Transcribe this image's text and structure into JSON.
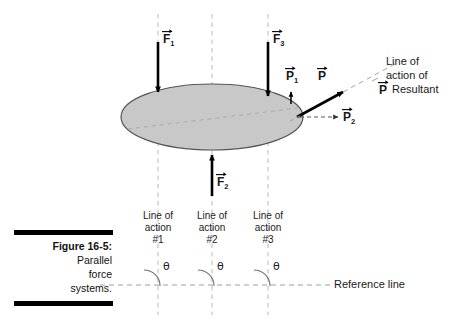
{
  "figure": {
    "caption_title": "Figure 16-5:",
    "caption_lines": [
      "Parallel",
      "force",
      "systems."
    ],
    "bar_color": "#000000"
  },
  "body": {
    "shape": "ellipse",
    "fill_color": "#c8c8c8",
    "stroke_color": "#555555"
  },
  "forces": [
    {
      "id": "F1",
      "symbol": "F",
      "subscript": "1",
      "direction": "down",
      "label": "F⃗1"
    },
    {
      "id": "F2",
      "symbol": "F",
      "subscript": "2",
      "direction": "up",
      "label": "F⃗2"
    },
    {
      "id": "F3",
      "symbol": "F",
      "subscript": "3",
      "direction": "down",
      "label": "F⃗3"
    }
  ],
  "resultant_components": [
    {
      "id": "P1",
      "symbol": "P",
      "subscript": "1",
      "direction": "up",
      "label": "P⃗1"
    },
    {
      "id": "P",
      "symbol": "P",
      "subscript": "",
      "direction": "diagonal-up-right",
      "label": "P⃗"
    },
    {
      "id": "P2",
      "symbol": "P",
      "subscript": "2",
      "direction": "right",
      "label": "P⃗2"
    }
  ],
  "resultant_note": {
    "line1": "Line of",
    "line2": "action of",
    "symbol": "P",
    "line3": "Resultant"
  },
  "lines_of_action": [
    {
      "title_line1": "Line of",
      "title_line2": "action",
      "number": "#1"
    },
    {
      "title_line1": "Line of",
      "title_line2": "action",
      "number": "#2"
    },
    {
      "title_line1": "Line of",
      "title_line2": "action",
      "number": "#3"
    }
  ],
  "angles": [
    {
      "label": "θ"
    },
    {
      "label": "θ"
    },
    {
      "label": "θ"
    }
  ],
  "reference_line": {
    "label": "Reference line"
  }
}
